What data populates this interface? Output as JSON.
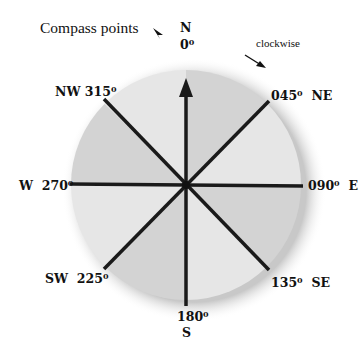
{
  "title": "Compass points",
  "direction_note": "clockwise",
  "colors": {
    "sector_dark": "#d3d3d3",
    "sector_light": "#e6e6e6",
    "shadow": "#cfcfcf",
    "lines": "#1a1a1a"
  },
  "points": {
    "N": {
      "letter": "N",
      "degrees": "0"
    },
    "NE": {
      "letter": "NE",
      "degrees": "045"
    },
    "E": {
      "letter": "E",
      "degrees": "090"
    },
    "SE": {
      "letter": "SE",
      "degrees": "135"
    },
    "S": {
      "letter": "S",
      "degrees": "180"
    },
    "SW": {
      "letter": "SW",
      "degrees": "225"
    },
    "W": {
      "letter": "W",
      "degrees": "270"
    },
    "NW": {
      "letter": "NW",
      "degrees": "315"
    }
  },
  "degree_symbol": "0"
}
